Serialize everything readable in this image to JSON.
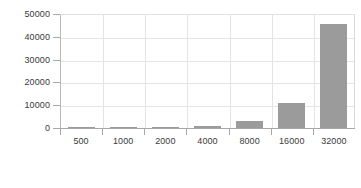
{
  "chart_data": {
    "type": "bar",
    "title": "",
    "subtitle": "",
    "xlabel": "",
    "ylabel": "",
    "categories": [
      "500",
      "1000",
      "2000",
      "4000",
      "8000",
      "16000",
      "32000"
    ],
    "values": [
      50,
      200,
      350,
      900,
      2900,
      11000,
      45500
    ],
    "series": [
      {
        "name": "",
        "values": [
          50,
          200,
          350,
          900,
          2900,
          11000,
          45500
        ]
      }
    ],
    "ylim": [
      0,
      50000
    ],
    "yticks": [
      0,
      10000,
      20000,
      30000,
      40000,
      50000
    ],
    "ytick_labels": [
      "0",
      "10000",
      "20000",
      "30000",
      "40000",
      "50000"
    ],
    "xtick_labels": [
      "500",
      "1000",
      "2000",
      "4000",
      "8000",
      "16000",
      "32000"
    ],
    "grid": true,
    "grid_axis": "both",
    "legend": false,
    "legend_position": "none",
    "annotations": [],
    "colors": {
      "bar": "#9b9b9b",
      "grid": "#e4e4e4",
      "axis": "#a8a8a8",
      "text": "#3a3a3a",
      "background": "#ffffff"
    }
  }
}
